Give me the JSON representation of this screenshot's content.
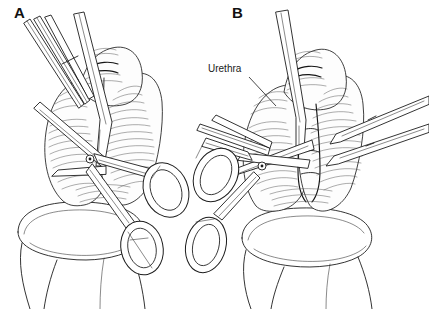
{
  "figure": {
    "caption_present": false,
    "background_color": "#ffffff",
    "ink_color": "#1d1d1d",
    "width": 429,
    "height": 309,
    "style": "pen-and-ink line art medical illustration"
  },
  "panels": [
    {
      "id": "a",
      "letter": "A",
      "letter_position": {
        "x": 14,
        "y": 5
      },
      "instruments": [
        {
          "name": "scissors",
          "detail": "curved surgical scissors with two finger rings, blades at tissue"
        },
        {
          "name": "forceps",
          "detail": "thin parallel forceps shafts entering from upper left"
        }
      ],
      "annotations": []
    },
    {
      "id": "b",
      "letter": "B",
      "letter_position": {
        "x": 232,
        "y": 5
      },
      "instruments": [
        {
          "name": "scissors",
          "detail": "surgical scissors angled from upper left with two finger rings on left"
        },
        {
          "name": "forceps",
          "detail": "two forceps shafts entering from right edge"
        }
      ],
      "annotations": [
        {
          "label": "Urethra",
          "text_position": {
            "x": 208,
            "y": 63
          },
          "leader_line": {
            "x1": 249,
            "y1": 77,
            "x2": 276,
            "y2": 106
          }
        }
      ]
    }
  ],
  "labels": {
    "panel_a": "A",
    "panel_b": "B",
    "urethra": "Urethra"
  }
}
